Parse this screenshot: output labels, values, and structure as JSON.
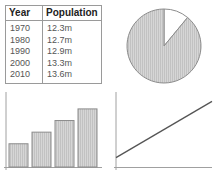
{
  "table": {
    "headers": [
      "Year",
      "Population"
    ],
    "rows": [
      {
        "year": "1970",
        "population": "12.3m"
      },
      {
        "year": "1980",
        "population": "12.7m"
      },
      {
        "year": "1990",
        "population": "12.9m"
      },
      {
        "year": "2000",
        "population": "13.3m"
      },
      {
        "year": "2010",
        "population": "13.6m"
      }
    ]
  },
  "chart_data": [
    {
      "type": "pie",
      "title": "",
      "slices": [
        {
          "label": "",
          "value": 11,
          "fill": "white"
        },
        {
          "label": "",
          "value": 89,
          "fill": "hatched-gray"
        }
      ]
    },
    {
      "type": "bar",
      "title": "",
      "categories": [
        "1",
        "2",
        "3",
        "4"
      ],
      "values": [
        2,
        3,
        4,
        5
      ],
      "ylim": [
        0,
        5.5
      ],
      "xlabel": "",
      "ylabel": ""
    },
    {
      "type": "line",
      "title": "",
      "x": [
        0,
        1
      ],
      "y": [
        1,
        7
      ],
      "ylim": [
        0,
        8
      ],
      "xlabel": "",
      "ylabel": ""
    }
  ],
  "colors": {
    "hatch_fill": "#d4d4d4",
    "hatch_line": "#bdbdbd",
    "stroke": "#8c8c8c",
    "line": "#555555"
  }
}
